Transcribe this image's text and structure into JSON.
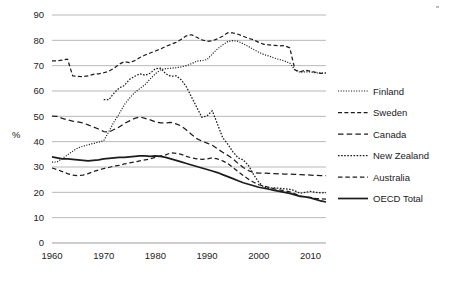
{
  "chart_data": {
    "type": "line",
    "title": "",
    "subtitle": "",
    "xlabel": "",
    "ylabel": "%",
    "xlim": [
      1960,
      2013
    ],
    "ylim": [
      0,
      90
    ],
    "grid": true,
    "legend_position": "right",
    "x_ticks": [
      "1960",
      "1970",
      "1980",
      "1990",
      "2000",
      "2010"
    ],
    "y_ticks": [
      "0",
      "10",
      "20",
      "30",
      "40",
      "50",
      "60",
      "70",
      "80",
      "90"
    ],
    "x": [
      1960,
      1961,
      1962,
      1963,
      1964,
      1965,
      1966,
      1967,
      1968,
      1969,
      1970,
      1971,
      1972,
      1973,
      1974,
      1975,
      1976,
      1977,
      1978,
      1979,
      1980,
      1981,
      1982,
      1983,
      1984,
      1985,
      1986,
      1987,
      1988,
      1989,
      1990,
      1991,
      1992,
      1993,
      1994,
      1995,
      1996,
      1997,
      1998,
      1999,
      2000,
      2001,
      2002,
      2003,
      2004,
      2005,
      2006,
      2007,
      2008,
      2009,
      2010,
      2011,
      2012,
      2013
    ],
    "series": [
      {
        "name": "Finland",
        "style": "dotted",
        "values": [
          31.9,
          32.0,
          33.4,
          34.8,
          36.2,
          37.5,
          38.2,
          38.8,
          39.3,
          39.8,
          40.4,
          44.0,
          47.8,
          51.0,
          54.6,
          57.2,
          59.4,
          61.0,
          62.5,
          64.8,
          66.8,
          68.4,
          68.8,
          69.0,
          69.2,
          69.5,
          70.0,
          70.8,
          71.8,
          72.0,
          72.4,
          74.6,
          76.6,
          78.2,
          79.5,
          79.9,
          79.6,
          78.6,
          77.6,
          76.4,
          75.3,
          74.4,
          73.8,
          73.0,
          72.4,
          71.8,
          71.0,
          68.2,
          67.4,
          67.6,
          67.5,
          67.2,
          67.0,
          67.1
        ]
      },
      {
        "name": "Sweden",
        "style": "dashed",
        "values": [
          71.9,
          71.9,
          72.2,
          72.6,
          66.0,
          65.8,
          65.7,
          66.0,
          66.6,
          66.8,
          67.2,
          67.8,
          69.0,
          70.6,
          71.6,
          71.2,
          72.0,
          73.2,
          74.2,
          75.0,
          75.8,
          76.6,
          77.6,
          78.4,
          79.2,
          80.4,
          81.8,
          82.2,
          81.2,
          80.2,
          79.6,
          79.8,
          80.6,
          81.6,
          83.0,
          82.9,
          82.4,
          81.6,
          80.8,
          80.2,
          79.2,
          78.4,
          78.2,
          78.0,
          77.8,
          77.9,
          77.0,
          68.3,
          67.6,
          68.2,
          67.8,
          67.4,
          67.0,
          67.2
        ]
      },
      {
        "name": "Canada",
        "style": "longdash",
        "values": [
          50.1,
          50.0,
          49.2,
          48.6,
          48.1,
          47.8,
          47.4,
          46.6,
          45.8,
          45.0,
          44.0,
          43.8,
          44.8,
          45.8,
          47.2,
          48.2,
          49.2,
          49.8,
          49.2,
          48.6,
          47.8,
          47.4,
          47.4,
          47.6,
          47.0,
          46.2,
          44.6,
          42.8,
          41.2,
          40.2,
          39.4,
          38.6,
          37.2,
          35.8,
          34.6,
          33.2,
          31.4,
          29.8,
          28.6,
          27.8,
          27.6,
          27.6,
          27.5,
          27.4,
          27.3,
          27.2,
          27.2,
          27.1,
          27.0,
          26.9,
          26.8,
          26.7,
          26.6,
          26.6
        ]
      },
      {
        "name": "New Zealand",
        "style": "dotted2",
        "values": [
          null,
          null,
          null,
          null,
          null,
          null,
          null,
          null,
          null,
          null,
          56.6,
          56.6,
          59.2,
          61.2,
          62.2,
          64.6,
          65.8,
          66.8,
          66.2,
          67.0,
          68.8,
          69.0,
          66.8,
          65.8,
          66.0,
          64.4,
          61.6,
          57.6,
          53.6,
          49.6,
          50.2,
          52.2,
          47.0,
          41.6,
          39.0,
          36.0,
          33.6,
          32.8,
          30.6,
          27.0,
          24.0,
          22.0,
          21.6,
          21.8,
          21.6,
          21.4,
          21.2,
          20.6,
          19.6,
          20.0,
          20.4,
          20.0,
          19.8,
          19.9
        ]
      },
      {
        "name": "Australia",
        "style": "dashed2",
        "values": [
          29.6,
          29.0,
          28.2,
          27.4,
          26.8,
          26.6,
          26.8,
          27.4,
          28.2,
          28.8,
          29.4,
          29.8,
          30.4,
          30.6,
          31.2,
          31.6,
          32.0,
          32.4,
          32.8,
          33.2,
          33.8,
          34.4,
          34.8,
          35.6,
          35.4,
          35.0,
          34.2,
          33.6,
          33.2,
          33.0,
          33.2,
          33.6,
          33.2,
          32.4,
          31.4,
          29.8,
          28.2,
          26.6,
          25.2,
          24.0,
          23.0,
          22.4,
          22.0,
          21.4,
          21.0,
          20.6,
          20.2,
          19.4,
          18.6,
          18.2,
          18.0,
          17.6,
          17.4,
          17.3
        ]
      },
      {
        "name": "OECD Total",
        "style": "solid",
        "values": [
          34.0,
          33.6,
          33.2,
          33.2,
          33.0,
          32.8,
          32.6,
          32.4,
          32.6,
          32.8,
          33.2,
          33.4,
          33.6,
          33.8,
          33.8,
          34.0,
          34.2,
          34.4,
          34.4,
          34.2,
          34.4,
          34.2,
          33.8,
          33.2,
          32.6,
          32.0,
          31.4,
          30.8,
          30.2,
          29.6,
          29.0,
          28.4,
          27.8,
          27.0,
          26.2,
          25.4,
          24.6,
          23.8,
          23.2,
          22.6,
          22.0,
          21.6,
          21.2,
          20.8,
          20.4,
          20.0,
          19.6,
          19.0,
          18.4,
          18.2,
          17.8,
          17.2,
          16.6,
          16.2
        ]
      }
    ]
  },
  "legend": {
    "items": [
      {
        "label": "Finland"
      },
      {
        "label": "Sweden"
      },
      {
        "label": "Canada"
      },
      {
        "label": "New Zealand"
      },
      {
        "label": "Australia"
      },
      {
        "label": "OECD Total"
      }
    ]
  }
}
